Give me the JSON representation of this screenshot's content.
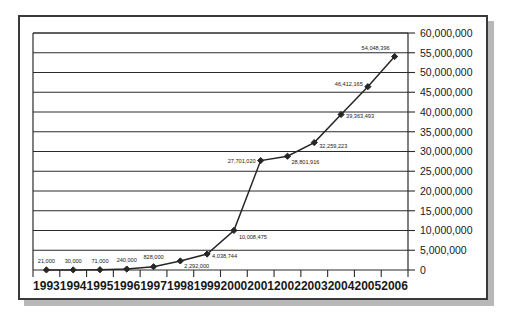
{
  "chart_data": {
    "type": "line",
    "title": "",
    "subtitle": "",
    "xlabel": "",
    "ylabel": "",
    "categories": [
      "1993",
      "1994",
      "1995",
      "1996",
      "1997",
      "1998",
      "1999",
      "2000",
      "2001",
      "2002",
      "2003",
      "2004",
      "2005",
      "2006"
    ],
    "values": [
      21000,
      30000,
      71000,
      240000,
      828000,
      2292000,
      4038744,
      10008475,
      27701020,
      28801916,
      32259223,
      39363493,
      46412165,
      54048396
    ],
    "point_labels": [
      "21,000",
      "30,000",
      "71,000",
      "240,000",
      "828,000",
      "2,292,000",
      "4,038,744",
      "10,008,475",
      "27,701,020",
      "28,801,916",
      "32,259,223",
      "39,363,493",
      "46,412,165",
      "54,048,396"
    ],
    "ylim": [
      0,
      60000000
    ],
    "yticks": [
      0,
      5000000,
      10000000,
      15000000,
      20000000,
      25000000,
      30000000,
      35000000,
      40000000,
      45000000,
      50000000,
      55000000,
      60000000
    ],
    "ytick_labels": [
      "0",
      "5,000,000",
      "10,000,000",
      "15,000,000",
      "20,000,000",
      "25,000,000",
      "30,000,000",
      "35,000,000",
      "40,000,000",
      "45,000,000",
      "50,000,000",
      "55,000,000",
      "60,000,000"
    ],
    "xtick_labels": [
      "1993",
      "1994",
      "1995",
      "1996",
      "1997",
      "1998",
      "1999",
      "2000",
      "2001",
      "2002",
      "2003",
      "2004",
      "2005",
      "2006"
    ],
    "grid": true,
    "grid_axis": "y",
    "legend": null,
    "legend_position": "none",
    "series_color": "#262626",
    "marker": "diamond",
    "line_color": "#262626",
    "frame_color": "#3a3a3a",
    "background": "#ffffff"
  },
  "frame": {
    "border_color": "#3a3a3a",
    "shadow_color": "#b8b8b8"
  }
}
